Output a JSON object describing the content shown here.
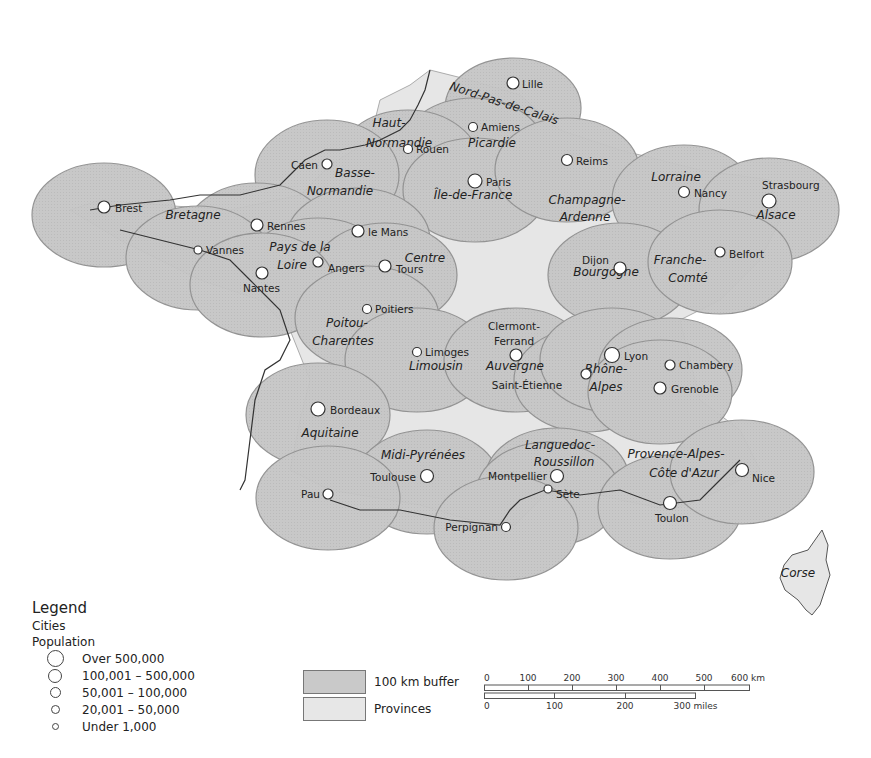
{
  "map": {
    "colors": {
      "buffer": "#c9c9c9",
      "buffer_stroke": "#8e8e8e",
      "province": "#e7e7e7",
      "border": "#9a9a9a",
      "coast": "#333333",
      "city_fill": "#ffffff",
      "city_stroke": "#333333"
    },
    "regions": [
      {
        "name": "Nord-Pas-de-Calais",
        "x": 503,
        "y": 107,
        "rot": 18
      },
      {
        "name": "Picardie",
        "x": 492,
        "y": 147
      },
      {
        "name": "Haut-",
        "x": 389,
        "y": 127
      },
      {
        "name": "Normandie",
        "x": 399,
        "y": 147
      },
      {
        "name": "Basse-",
        "x": 355,
        "y": 177
      },
      {
        "name": "Normandie",
        "x": 340,
        "y": 195
      },
      {
        "name": "Île-de-France",
        "x": 473,
        "y": 199
      },
      {
        "name": "Champagne-",
        "x": 587,
        "y": 204
      },
      {
        "name": "Ardenne",
        "x": 585,
        "y": 221
      },
      {
        "name": "Lorraine",
        "x": 676,
        "y": 181
      },
      {
        "name": "Alsace",
        "x": 776,
        "y": 219
      },
      {
        "name": "Bretagne",
        "x": 193,
        "y": 219
      },
      {
        "name": "Pays de la",
        "x": 300,
        "y": 251
      },
      {
        "name": "Loire",
        "x": 292,
        "y": 269
      },
      {
        "name": "Centre",
        "x": 425,
        "y": 262
      },
      {
        "name": "Bourgogne",
        "x": 606,
        "y": 276
      },
      {
        "name": "Franche-",
        "x": 680,
        "y": 264
      },
      {
        "name": "Comté",
        "x": 688,
        "y": 282
      },
      {
        "name": "Poitou-",
        "x": 347,
        "y": 327
      },
      {
        "name": "Charentes",
        "x": 343,
        "y": 345
      },
      {
        "name": "Limousin",
        "x": 436,
        "y": 370
      },
      {
        "name": "Auvergne",
        "x": 515,
        "y": 370
      },
      {
        "name": "Rhône-",
        "x": 606,
        "y": 373
      },
      {
        "name": "Alpes",
        "x": 606,
        "y": 391
      },
      {
        "name": "Aquitaine",
        "x": 330,
        "y": 437
      },
      {
        "name": "Midi-Pyrénées",
        "x": 423,
        "y": 459
      },
      {
        "name": "Languedoc-",
        "x": 560,
        "y": 449
      },
      {
        "name": "Roussillon",
        "x": 564,
        "y": 466
      },
      {
        "name": "Provence-Alpes-",
        "x": 676,
        "y": 458
      },
      {
        "name": "Côte d'Azur",
        "x": 684,
        "y": 477
      },
      {
        "name": "Corse",
        "x": 798,
        "y": 577
      }
    ],
    "cities": [
      {
        "name": "Lille",
        "x": 513,
        "y": 83,
        "r": 6,
        "lx": 522,
        "ly": 88,
        "anchor": "start"
      },
      {
        "name": "Amiens",
        "x": 473,
        "y": 127,
        "r": 4.5,
        "lx": 481,
        "ly": 131,
        "anchor": "start"
      },
      {
        "name": "Rouen",
        "x": 408,
        "y": 149,
        "r": 4.5,
        "lx": 416,
        "ly": 153,
        "anchor": "start"
      },
      {
        "name": "Caen",
        "x": 327,
        "y": 164,
        "r": 5,
        "lx": 318,
        "ly": 169,
        "anchor": "end"
      },
      {
        "name": "Paris",
        "x": 475,
        "y": 181,
        "r": 7,
        "lx": 486,
        "ly": 186,
        "anchor": "start"
      },
      {
        "name": "Reims",
        "x": 567,
        "y": 160,
        "r": 5.5,
        "lx": 576,
        "ly": 165,
        "anchor": "start"
      },
      {
        "name": "Nancy",
        "x": 684,
        "y": 192,
        "r": 5.5,
        "lx": 694,
        "ly": 197,
        "anchor": "start"
      },
      {
        "name": "Strasbourg",
        "x": 769,
        "y": 201,
        "r": 7,
        "lx": 762,
        "ly": 189,
        "anchor": "start"
      },
      {
        "name": "Brest",
        "x": 104,
        "y": 207,
        "r": 6,
        "lx": 115,
        "ly": 212,
        "anchor": "start"
      },
      {
        "name": "Rennes",
        "x": 257,
        "y": 225,
        "r": 6,
        "lx": 267,
        "ly": 230,
        "anchor": "start"
      },
      {
        "name": "le Mans",
        "x": 358,
        "y": 231,
        "r": 6,
        "lx": 368,
        "ly": 236,
        "anchor": "start"
      },
      {
        "name": "Vannes",
        "x": 198,
        "y": 250,
        "r": 4,
        "lx": 206,
        "ly": 254,
        "anchor": "start"
      },
      {
        "name": "Angers",
        "x": 318,
        "y": 262,
        "r": 5,
        "lx": 328,
        "ly": 272,
        "anchor": "start"
      },
      {
        "name": "Tours",
        "x": 385,
        "y": 266,
        "r": 6,
        "lx": 396,
        "ly": 273,
        "anchor": "start"
      },
      {
        "name": "Nantes",
        "x": 262,
        "y": 273,
        "r": 6,
        "lx": 243,
        "ly": 292,
        "anchor": "start"
      },
      {
        "name": "Dijon",
        "x": 620,
        "y": 268,
        "r": 6,
        "lx": 609,
        "ly": 264,
        "anchor": "end"
      },
      {
        "name": "Belfort",
        "x": 720,
        "y": 252,
        "r": 5,
        "lx": 729,
        "ly": 258,
        "anchor": "start"
      },
      {
        "name": "Poitiers",
        "x": 367,
        "y": 309,
        "r": 4.5,
        "lx": 375,
        "ly": 313,
        "anchor": "start"
      },
      {
        "name": "Clermont-",
        "x": 516,
        "y": 355,
        "r": 6,
        "lx": 514,
        "ly": 330,
        "anchor": "middle"
      },
      {
        "name": "Limoges",
        "x": 417,
        "y": 352,
        "r": 4.5,
        "lx": 425,
        "ly": 356,
        "anchor": "start"
      },
      {
        "name": "Lyon",
        "x": 612,
        "y": 355,
        "r": 7.5,
        "lx": 624,
        "ly": 360,
        "anchor": "start"
      },
      {
        "name": "Chambery",
        "x": 670,
        "y": 365,
        "r": 5,
        "lx": 679,
        "ly": 369,
        "anchor": "start"
      },
      {
        "name": "Saint-Étienne",
        "x": 586,
        "y": 374,
        "r": 5,
        "lx": 527,
        "ly": 389,
        "anchor": "middle"
      },
      {
        "name": "Grenoble",
        "x": 660,
        "y": 388,
        "r": 6,
        "lx": 671,
        "ly": 393,
        "anchor": "start"
      },
      {
        "name": "Bordeaux",
        "x": 318,
        "y": 409,
        "r": 7,
        "lx": 330,
        "ly": 414,
        "anchor": "start"
      },
      {
        "name": "Toulouse",
        "x": 427,
        "y": 476,
        "r": 6.5,
        "lx": 416,
        "ly": 481,
        "anchor": "end"
      },
      {
        "name": "Pau",
        "x": 328,
        "y": 494,
        "r": 5,
        "lx": 320,
        "ly": 498,
        "anchor": "end"
      },
      {
        "name": "Montpellier",
        "x": 557,
        "y": 476,
        "r": 6.5,
        "lx": 547,
        "ly": 480,
        "anchor": "end"
      },
      {
        "name": "Sète",
        "x": 548,
        "y": 489,
        "r": 4,
        "lx": 556,
        "ly": 498,
        "anchor": "start"
      },
      {
        "name": "Nice",
        "x": 742,
        "y": 470,
        "r": 6.5,
        "lx": 752,
        "ly": 482,
        "anchor": "start"
      },
      {
        "name": "Toulon",
        "x": 670,
        "y": 503,
        "r": 6.5,
        "lx": 655,
        "ly": 522,
        "anchor": "start"
      },
      {
        "name": "Perpignan",
        "x": 506,
        "y": 527,
        "r": 4.5,
        "lx": 498,
        "ly": 531,
        "anchor": "end"
      }
    ],
    "city_extra": [
      {
        "name": "Ferrand",
        "x": 514,
        "y": 345
      }
    ]
  },
  "legend": {
    "title": "Legend",
    "subtitle1": "Cities",
    "subtitle2": "Population",
    "classes": [
      {
        "label": "Over 500,000",
        "size": 15
      },
      {
        "label": "100,001 – 500,000",
        "size": 12
      },
      {
        "label": "50,001 – 100,000",
        "size": 9
      },
      {
        "label": "20,001 – 50,000",
        "size": 7
      },
      {
        "label": "Under 1,000",
        "size": 5
      }
    ],
    "areas": [
      {
        "label": "100 km buffer",
        "color": "#c9c9c9"
      },
      {
        "label": "Provinces",
        "color": "#e7e7e7"
      }
    ]
  },
  "scale": {
    "km_ticks": [
      "0",
      "100",
      "200",
      "300",
      "400",
      "500",
      "600 km"
    ],
    "mile_ticks": [
      "0",
      "100",
      "200",
      "300 miles"
    ]
  }
}
